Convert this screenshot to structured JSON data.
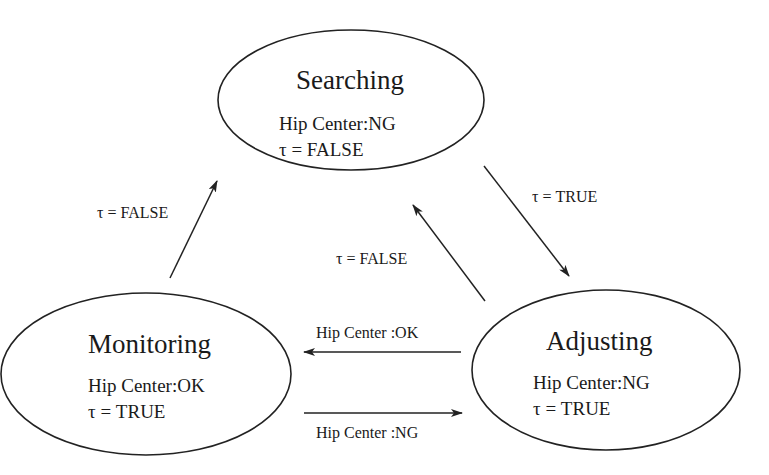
{
  "diagram": {
    "type": "state-machine",
    "states": {
      "searching": {
        "title": "Searching",
        "hip_center": "Hip Center:NG",
        "tau": "τ = FALSE"
      },
      "monitoring": {
        "title": "Monitoring",
        "hip_center": "Hip Center:OK",
        "tau": "τ = TRUE"
      },
      "adjusting": {
        "title": "Adjusting",
        "hip_center": "Hip Center:NG",
        "tau": "τ = TRUE"
      }
    },
    "transitions": {
      "monitoring_to_searching": {
        "from": "Monitoring",
        "to": "Searching",
        "label": "τ = FALSE"
      },
      "searching_to_adjusting": {
        "from": "Searching",
        "to": "Adjusting",
        "label": "τ = TRUE"
      },
      "adjusting_to_searching": {
        "from": "Adjusting",
        "to": "Searching",
        "label": "τ = FALSE"
      },
      "adjusting_to_monitoring": {
        "from": "Adjusting",
        "to": "Monitoring",
        "label": "Hip Center :OK"
      },
      "monitoring_to_adjusting": {
        "from": "Monitoring",
        "to": "Adjusting",
        "label": "Hip Center :NG"
      }
    },
    "colors": {
      "stroke": "#222222",
      "text": "#1a1a1a",
      "background": "#ffffff"
    }
  }
}
